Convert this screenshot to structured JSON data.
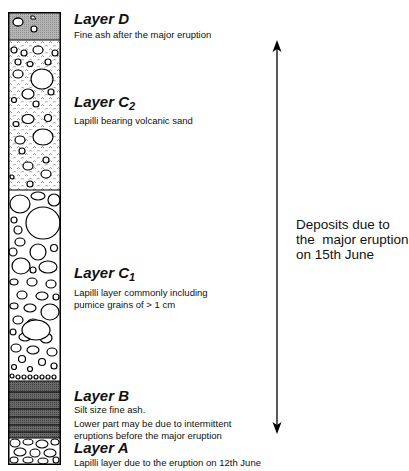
{
  "diagram": {
    "type": "stratigraphic-column",
    "layers": [
      {
        "id": "D",
        "title": "Layer D",
        "subscript": "",
        "description": [
          "Fine ash after the major eruption"
        ],
        "pattern": "gray-ash-with-clasts"
      },
      {
        "id": "C2",
        "title": "Layer C",
        "subscript": "2",
        "description": [
          "Lapilli bearing volcanic sand"
        ],
        "pattern": "sand-with-lapilli"
      },
      {
        "id": "C1",
        "title": "Layer C",
        "subscript": "1",
        "description": [
          "Lapilli layer commonly including",
          "pumice grains of > 1 cm"
        ],
        "pattern": "coarse-lapilli"
      },
      {
        "id": "B",
        "title": "Layer B",
        "subscript": "",
        "description": [
          "Silt size fine ash.",
          "Lower part may be due to  intermittent",
          "eruptions before the major eruption"
        ],
        "pattern": "dark-laminated-ash"
      },
      {
        "id": "A",
        "title": "Layer A",
        "subscript": "",
        "description": [
          "Lapilli layer due to the eruption on 12th June"
        ],
        "pattern": "lapilli"
      }
    ],
    "bracket": {
      "direction": "double-arrow-vertical",
      "label": [
        "Deposits due to",
        "the  major eruption",
        "on 15th June"
      ]
    }
  }
}
